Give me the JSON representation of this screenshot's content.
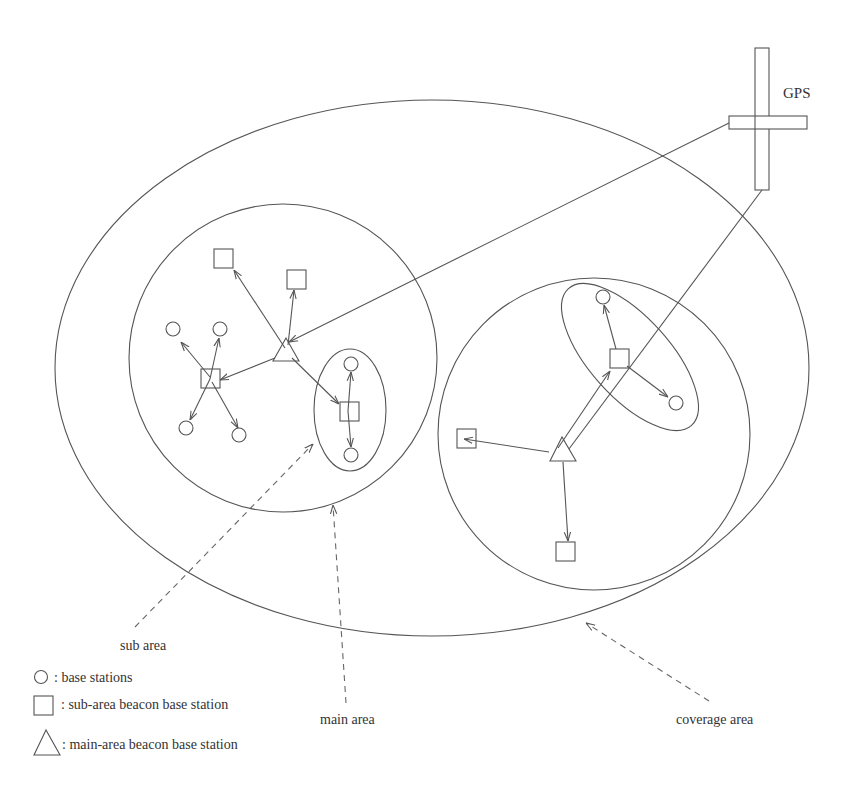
{
  "diagram": {
    "labels": {
      "gps": "GPS",
      "sub_area": "sub area",
      "main_area": "main area",
      "coverage_area": "coverage area"
    },
    "legend": [
      {
        "symbol": "circle",
        "text": ": base stations"
      },
      {
        "symbol": "square",
        "text": ": sub-area beacon base station"
      },
      {
        "symbol": "triangle",
        "text": ": main-area beacon base station"
      }
    ],
    "colors": {
      "stroke": "#555555",
      "text": "#333333",
      "background": "#ffffff"
    },
    "nodes": {
      "left_main_area": {
        "main_beacon": "triangle",
        "sub_beacons": [
          "square",
          "square",
          "square",
          "square"
        ],
        "base_stations": [
          "circle",
          "circle",
          "circle",
          "circle",
          "circle",
          "circle"
        ]
      },
      "right_main_area": {
        "main_beacon": "triangle",
        "sub_beacons": [
          "square",
          "square",
          "square"
        ],
        "base_stations": [
          "circle",
          "circle"
        ]
      }
    }
  }
}
